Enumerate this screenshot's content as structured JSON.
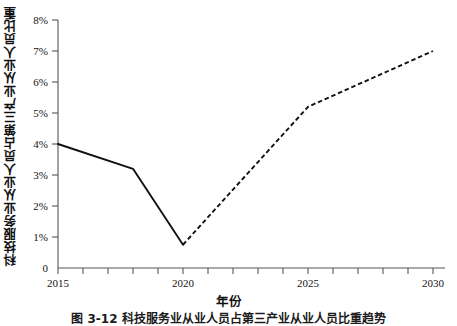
{
  "chart_data": {
    "type": "line",
    "title": "",
    "xlabel": "年份",
    "ylabel": "科技服务业从业人员占第三产业从业人员比重",
    "xlim": [
      2015,
      2030
    ],
    "ylim": [
      0,
      8
    ],
    "grid": false,
    "legend": "none",
    "x_tick_values": [
      2015,
      2016,
      2017,
      2018,
      2019,
      2020,
      2021,
      2022,
      2023,
      2024,
      2025,
      2026,
      2027,
      2028,
      2029,
      2030
    ],
    "x_tick_labels": [
      "2015",
      "",
      "",
      "",
      "",
      "2020",
      "",
      "",
      "",
      "",
      "2025",
      "",
      "",
      "",
      "",
      "2030"
    ],
    "x_labeled_ticks": [
      "2015",
      "2020",
      "2025",
      "2030"
    ],
    "y_tick_values": [
      0,
      1,
      2,
      3,
      4,
      5,
      6,
      7,
      8
    ],
    "y_tick_labels": [
      "0",
      "1%",
      "2%",
      "3%",
      "4%",
      "5%",
      "6%",
      "7%",
      "8%"
    ],
    "series": [
      {
        "name": "历史值",
        "style": "solid",
        "color": "#111111",
        "x": [
          2015,
          2018,
          2020
        ],
        "values": [
          4.0,
          3.2,
          0.75
        ]
      },
      {
        "name": "预测值",
        "style": "dashed",
        "color": "#111111",
        "x": [
          2020,
          2025,
          2030
        ],
        "values": [
          0.75,
          5.2,
          7.0
        ]
      }
    ]
  },
  "axis": {
    "x_title": "年份",
    "y_title": "科技服务业从业人员占第三产业从业人员比重"
  },
  "caption": {
    "text": "图 3-12 科技服务业从业人员占第三产业从业人员比重趋势"
  }
}
